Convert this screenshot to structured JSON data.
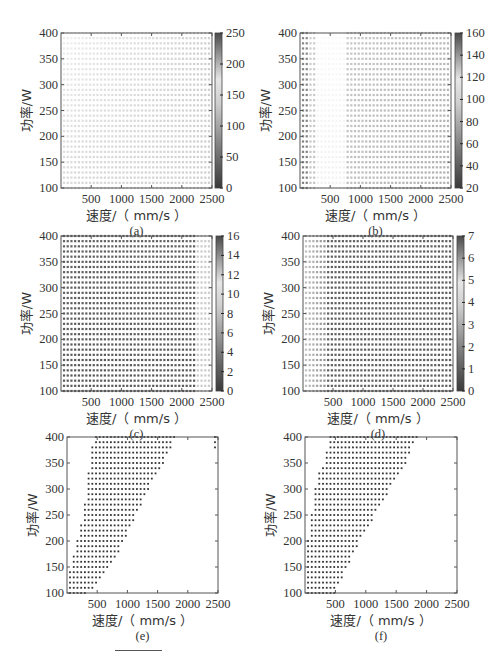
{
  "figure": {
    "footer_rule": true
  },
  "chart_data": [
    {
      "id": "a",
      "type": "heatmap",
      "panel_label": "(a)",
      "xlabel": "速度/（ mm/s ）",
      "ylabel": "功率/W",
      "xlim": [
        0,
        2500
      ],
      "ylim": [
        100,
        400
      ],
      "xticks": [
        500,
        1000,
        1500,
        2000,
        2500
      ],
      "yticks": [
        100,
        150,
        200,
        250,
        300,
        350,
        400
      ],
      "colorbar": {
        "min": 0,
        "max": 250,
        "ticks": [
          0,
          50,
          100,
          150,
          200,
          250
        ]
      },
      "grid": {
        "nx": 40,
        "ny": 31
      },
      "pattern": "mostly-high-uniform",
      "description": "Near-uniform light values (~170-190) across the full domain, lighter near low speed at high power"
    },
    {
      "id": "b",
      "type": "heatmap",
      "panel_label": "(b)",
      "xlabel": "速度/（ mm/s ）",
      "ylabel": "功率/W",
      "xlim": [
        0,
        2500
      ],
      "ylim": [
        100,
        400
      ],
      "xticks": [
        500,
        1000,
        1500,
        2000,
        2500
      ],
      "yticks": [
        100,
        150,
        200,
        250,
        300,
        350,
        400
      ],
      "colorbar": {
        "min": 20,
        "max": 160,
        "ticks": [
          20,
          40,
          60,
          80,
          100,
          120,
          140,
          160
        ]
      },
      "grid": {
        "nx": 40,
        "ny": 31
      },
      "pattern": "light-left-band",
      "description": "Light band near 300-700 mm/s, darker columns at lowest speed, mid-grey elsewhere"
    },
    {
      "id": "c",
      "type": "heatmap",
      "panel_label": "(c)",
      "xlabel": "速度/（ mm/s ）",
      "ylabel": "功率/W",
      "xlim": [
        0,
        2500
      ],
      "ylim": [
        100,
        400
      ],
      "xticks": [
        500,
        1000,
        1500,
        2000,
        2500
      ],
      "yticks": [
        100,
        150,
        200,
        250,
        300,
        350,
        400
      ],
      "colorbar": {
        "min": 0,
        "max": 16,
        "ticks": [
          0,
          2,
          4,
          6,
          8,
          10,
          12,
          14,
          16
        ]
      },
      "grid": {
        "nx": 40,
        "ny": 31
      },
      "pattern": "dark-with-light-right",
      "description": "Mostly dark (low) values, lighter columns near 2300-2500 mm/s"
    },
    {
      "id": "d",
      "type": "heatmap",
      "panel_label": "(d)",
      "xlabel": "速度/（ mm/s ）",
      "ylabel": "功率/W",
      "xlim": [
        0,
        2500
      ],
      "ylim": [
        100,
        400
      ],
      "xticks": [
        500,
        1000,
        1500,
        2000,
        2500
      ],
      "yticks": [
        100,
        150,
        200,
        250,
        300,
        350,
        400
      ],
      "colorbar": {
        "min": 0,
        "max": 7,
        "ticks": [
          0,
          1,
          2,
          3,
          4,
          5,
          6,
          7
        ]
      },
      "grid": {
        "nx": 40,
        "ny": 31
      },
      "pattern": "light-left-dark-right",
      "description": "Lighter values at low speed (< 500 mm/s), dark elsewhere"
    },
    {
      "id": "e",
      "type": "scatter",
      "panel_label": "(e)",
      "xlabel": "速度/（ mm/s ）",
      "ylabel": "功率/W",
      "xlim": [
        0,
        2500
      ],
      "ylim": [
        100,
        400
      ],
      "xticks": [
        500,
        1000,
        1500,
        2000,
        2500
      ],
      "yticks": [
        100,
        150,
        200,
        250,
        300,
        350,
        400
      ],
      "grid": {
        "nx": 40,
        "ny": 31
      },
      "region": {
        "description": "Feasible process window: points between a lower-speed boundary and a linear upper-speed boundary",
        "left_boundary": [
          [
            100,
            50
          ],
          [
            140,
            50
          ],
          [
            190,
            150
          ],
          [
            230,
            230
          ],
          [
            280,
            300
          ],
          [
            330,
            350
          ],
          [
            370,
            400
          ],
          [
            400,
            450
          ]
        ],
        "right_boundary": [
          [
            100,
            350
          ],
          [
            150,
            700
          ],
          [
            200,
            950
          ],
          [
            250,
            1150
          ],
          [
            300,
            1350
          ],
          [
            350,
            1600
          ],
          [
            400,
            1800
          ]
        ],
        "outlier_points": [
          [
            380,
            2450
          ],
          [
            390,
            2450
          ],
          [
            400,
            2450
          ]
        ]
      }
    },
    {
      "id": "f",
      "type": "scatter",
      "panel_label": "(f)",
      "xlabel": "速度/（ mm/s ）",
      "ylabel": "功率/W",
      "xlim": [
        0,
        2500
      ],
      "ylim": [
        100,
        400
      ],
      "xticks": [
        500,
        1000,
        1500,
        2000,
        2500
      ],
      "yticks": [
        100,
        150,
        200,
        250,
        300,
        350,
        400
      ],
      "grid": {
        "nx": 40,
        "ny": 31
      },
      "region": {
        "description": "Feasible process window slightly narrower than (e)",
        "left_boundary": [
          [
            100,
            50
          ],
          [
            200,
            50
          ],
          [
            250,
            100
          ],
          [
            320,
            200
          ],
          [
            350,
            300
          ],
          [
            400,
            400
          ]
        ],
        "right_boundary": [
          [
            100,
            500
          ],
          [
            150,
            700
          ],
          [
            200,
            900
          ],
          [
            250,
            1150
          ],
          [
            300,
            1400
          ],
          [
            350,
            1650
          ],
          [
            400,
            1850
          ]
        ],
        "outlier_points": []
      }
    }
  ],
  "layout": {
    "panels": {
      "a": {
        "left": 61,
        "top": 33,
        "width": 151,
        "height": 155,
        "cbar_left": 215
      },
      "b": {
        "left": 300,
        "top": 33,
        "width": 151,
        "height": 155,
        "cbar_left": 455
      },
      "c": {
        "left": 61,
        "top": 236,
        "width": 151,
        "height": 155,
        "cbar_left": 216
      },
      "d": {
        "left": 303,
        "top": 236,
        "width": 150,
        "height": 155,
        "cbar_left": 457
      },
      "e": {
        "left": 67,
        "top": 437,
        "width": 151,
        "height": 156,
        "cbar_left": null
      },
      "f": {
        "left": 305,
        "top": 437,
        "width": 152,
        "height": 156,
        "cbar_left": null
      }
    }
  }
}
